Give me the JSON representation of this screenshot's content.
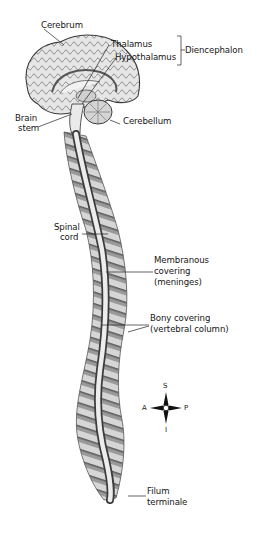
{
  "diagram": {
    "labels": {
      "cerebrum": "Cerebrum",
      "thalamus": "Thalamus",
      "hypothalamus": "Hypothalamus",
      "diencephalon": "Diencephalon",
      "brain_stem_1": "Brain",
      "brain_stem_2": "stem",
      "cerebellum": "Cerebellum",
      "spinal_cord_1": "Spinal",
      "spinal_cord_2": "cord",
      "membranous_1": "Membranous",
      "membranous_2": "covering",
      "membranous_3": "(meninges)",
      "bony_1": "Bony covering",
      "bony_2": "(vertebral column)",
      "filum_1": "Filum",
      "filum_2": "terminale"
    },
    "compass": {
      "superior": "S",
      "inferior": "I",
      "anterior": "A",
      "posterior": "P"
    },
    "colors": {
      "ink": "#161616",
      "bone_dark": "#6e6e6e",
      "bone_light": "#d8d8d8",
      "cord": "#ececec",
      "brain_fill": "#e4e4e4"
    }
  }
}
